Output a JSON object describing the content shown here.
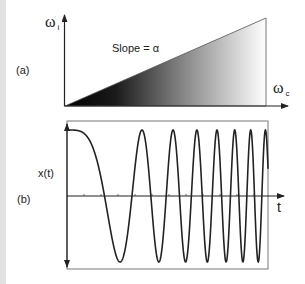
{
  "panel_a": {
    "label": "(a)",
    "y_axis_label": "ω",
    "y_axis_subscript": "i",
    "x_axis_label": "ω",
    "x_axis_subscript": "c",
    "annotation": "Slope = α",
    "gradient": {
      "start_color": "#000000",
      "end_color": "#ffffff"
    },
    "triangle": {
      "origin": [
        65,
        106
      ],
      "top_right": [
        266,
        18
      ],
      "bottom_right": [
        266,
        106
      ]
    }
  },
  "panel_b": {
    "label": "(b)",
    "y_axis_label": "x(t)",
    "x_axis_label": "t",
    "waveform": "linear chirp",
    "box": {
      "x": 67,
      "y": 121,
      "w": 201,
      "h": 148
    },
    "zero_axis_y": 196,
    "amplitude_px": 66,
    "chirp_phase_coeff": 0.001117,
    "start_x": 67,
    "end_x": 268,
    "peak_x": [
      67,
      142,
      172,
      195,
      216,
      232,
      248,
      264
    ],
    "trough_x": [
      120,
      159,
      185,
      207,
      226,
      242,
      258
    ],
    "tick_x": [
      84,
      101,
      118,
      135,
      152,
      169,
      186,
      203,
      220,
      237,
      254
    ]
  },
  "colors": {
    "line": "#222222",
    "box": "#777777",
    "strip": "#e2e2e2"
  }
}
